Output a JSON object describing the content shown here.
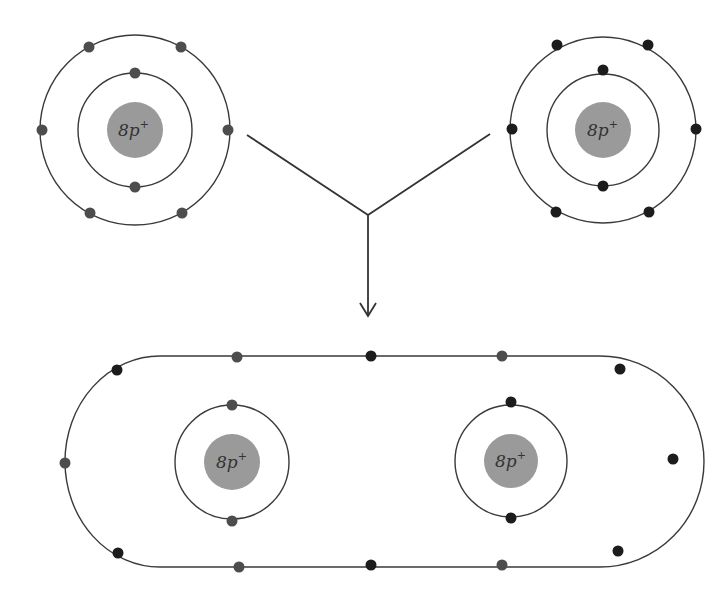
{
  "diagram": {
    "type": "covalent-bond-formation",
    "colors": {
      "nucleus": "#9a9a9a",
      "electron_left_atom": "#4d4d4d",
      "electron_right_atom": "#1c1c1c",
      "orbit": "#3a3a3a"
    },
    "atoms": [
      {
        "id": "left-oxygen-atom",
        "nucleus_label": "8p",
        "nucleus_charge": "+",
        "inner_shell_electrons": 2,
        "outer_shell_electrons": 6
      },
      {
        "id": "right-oxygen-atom",
        "nucleus_label": "8p",
        "nucleus_charge": "+",
        "inner_shell_electrons": 2,
        "outer_shell_electrons": 6
      }
    ],
    "molecule": {
      "id": "oxygen-molecule",
      "nuclei": [
        {
          "label": "8p",
          "charge": "+"
        },
        {
          "label": "8p",
          "charge": "+"
        }
      ],
      "inner_shell_electrons_each": 2,
      "shared_outer_shell_electrons": 12
    },
    "connector": "Y-shaped arrow pointing down from both atoms to molecule"
  }
}
